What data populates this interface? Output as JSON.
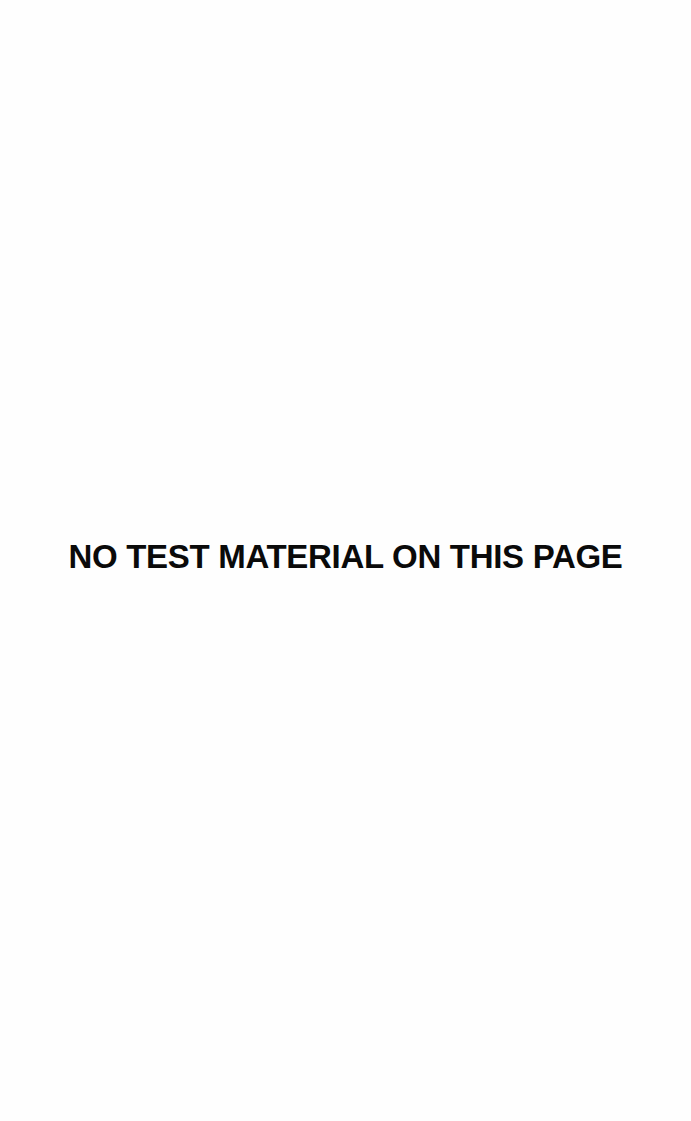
{
  "page": {
    "background_color": "#fefefe",
    "text_color": "#0a0a0a",
    "notice": "NO TEST MATERIAL ON THIS PAGE"
  }
}
